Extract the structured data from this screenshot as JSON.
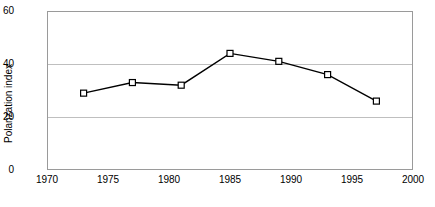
{
  "chart_data": {
    "type": "line",
    "title": "",
    "subtitle": "",
    "xlabel": "",
    "ylabel": "Polarization index",
    "x": [
      1973,
      1977,
      1981,
      1985,
      1989,
      1993,
      1997
    ],
    "values": [
      29,
      33,
      32,
      44,
      41,
      36,
      26
    ],
    "series": [
      {
        "name": "Polarization index",
        "x": [
          1973,
          1977,
          1981,
          1985,
          1989,
          1993,
          1997
        ],
        "values": [
          29,
          33,
          32,
          44,
          41,
          36,
          26
        ]
      }
    ],
    "xlim": [
      1970,
      2000
    ],
    "ylim": [
      0,
      60
    ],
    "xticks": [
      1970,
      1975,
      1980,
      1985,
      1990,
      1995,
      2000
    ],
    "yticks": [
      0,
      20,
      40,
      60
    ],
    "xtick_labels": [
      "1970",
      "1975",
      "1980",
      "1985",
      "1990",
      "1995",
      "2000"
    ],
    "ytick_labels": [
      "0",
      "20",
      "40",
      "60"
    ],
    "grid": "horizontal",
    "gridlines_y": [
      20,
      40
    ],
    "legend": "none",
    "marker": "open-square",
    "line_color": "#000000",
    "marker_fill": "#ffffff",
    "marker_edge": "#000000",
    "grid_color": "#bfbfbf",
    "frame_color": "#9a9a9a",
    "background": "#ffffff"
  },
  "axes": {
    "y_title": "Polarization index"
  }
}
